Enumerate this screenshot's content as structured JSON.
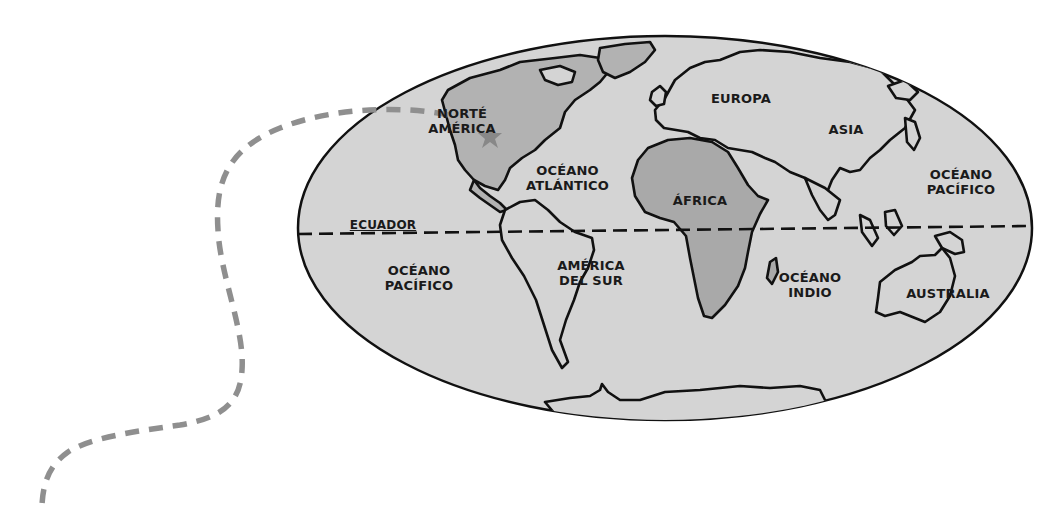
{
  "map": {
    "type": "world-map",
    "projection": "elliptical",
    "colors": {
      "ocean": "#d4d4d4",
      "continent_highlight": "#b2b2b2",
      "africa_fill": "#a9a9a9",
      "outline": "#111111",
      "route_dashed": "#8f8f8f",
      "background": "#ffffff"
    },
    "equator_label": "ECUADOR",
    "labels": {
      "north_america": [
        "NORTÉ",
        "AMÉRICA"
      ],
      "atlantic": [
        "OCÉANO",
        "ATLÁNTICO"
      ],
      "europe": [
        "EUROPA"
      ],
      "asia": [
        "ASIA"
      ],
      "africa": [
        "ÁFRICA"
      ],
      "pacific_east": [
        "OCÉANO",
        "PACÍFICO"
      ],
      "pacific_west": [
        "OCÉANO",
        "PACÍFICO"
      ],
      "south_america": [
        "AMÉRICA",
        "DEL SUR"
      ],
      "indian": [
        "OCÉANO",
        "INDIO"
      ],
      "australia": [
        "AUSTRALIA"
      ]
    },
    "marker": {
      "icon": "star-icon",
      "location": "North America"
    },
    "route": {
      "style": "dashed",
      "description": "dashed path leading from the lower-left margin to the star in North America"
    }
  }
}
